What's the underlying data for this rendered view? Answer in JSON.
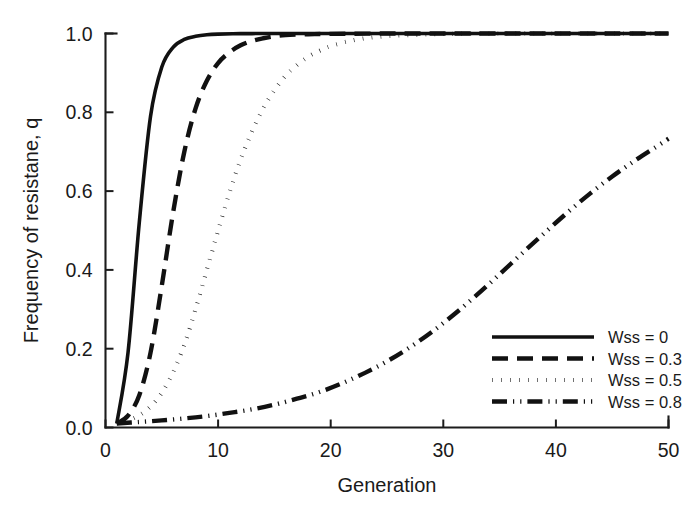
{
  "chart_data": {
    "type": "line",
    "title": "",
    "xlabel": "Generation",
    "ylabel": "Frequency of resistane, q",
    "xlim": [
      0,
      50
    ],
    "ylim": [
      0.0,
      1.0
    ],
    "xticks": [
      0,
      10,
      20,
      30,
      40,
      50
    ],
    "xtick_labels": [
      "0",
      "10",
      "20",
      "30",
      "40",
      "50"
    ],
    "yticks": [
      0.0,
      0.2,
      0.4,
      0.6,
      0.8,
      1.0
    ],
    "ytick_labels": [
      "0.0",
      "0.2",
      "0.4",
      "0.6",
      "0.8",
      "1.0"
    ],
    "grid": false,
    "legend_position": "lower right",
    "series": [
      {
        "name": "Wss = 0",
        "linestyle": "solid",
        "color": "#111111",
        "x": [
          1,
          2,
          3,
          4,
          5,
          6,
          7,
          8,
          9,
          10,
          12,
          14,
          16,
          18,
          20,
          25,
          30,
          35,
          40,
          45,
          50
        ],
        "values": [
          0.01,
          0.19,
          0.52,
          0.79,
          0.915,
          0.965,
          0.985,
          0.993,
          0.997,
          0.9985,
          0.9996,
          0.9999,
          1.0,
          1.0,
          1.0,
          1.0,
          1.0,
          1.0,
          1.0,
          1.0,
          1.0
        ]
      },
      {
        "name": "Wss = 0.3",
        "linestyle": "dashed",
        "color": "#111111",
        "x": [
          1,
          2,
          3,
          4,
          5,
          6,
          7,
          8,
          9,
          10,
          11,
          12,
          13,
          14,
          15,
          16,
          18,
          20,
          25,
          30,
          35,
          40,
          45,
          50
        ],
        "values": [
          0.01,
          0.03,
          0.082,
          0.19,
          0.36,
          0.545,
          0.7,
          0.81,
          0.88,
          0.925,
          0.952,
          0.97,
          0.981,
          0.988,
          0.993,
          0.996,
          0.998,
          0.999,
          1.0,
          1.0,
          1.0,
          1.0,
          1.0,
          1.0
        ]
      },
      {
        "name": "Wss = 0.5",
        "linestyle": "dotted",
        "color": "#111111",
        "x": [
          1,
          2,
          3,
          4,
          5,
          6,
          7,
          8,
          9,
          10,
          11,
          12,
          13,
          14,
          15,
          16,
          17,
          18,
          19,
          20,
          22,
          24,
          26,
          28,
          30,
          35,
          40,
          45,
          50
        ],
        "values": [
          0.01,
          0.018,
          0.031,
          0.053,
          0.088,
          0.14,
          0.21,
          0.3,
          0.4,
          0.5,
          0.595,
          0.68,
          0.75,
          0.81,
          0.856,
          0.893,
          0.92,
          0.941,
          0.956,
          0.968,
          0.983,
          0.991,
          0.995,
          0.997,
          0.999,
          1.0,
          1.0,
          1.0,
          1.0
        ]
      },
      {
        "name": "Wss = 0.8",
        "linestyle": "dashdot",
        "color": "#111111",
        "x": [
          1,
          3,
          5,
          7,
          9,
          11,
          13,
          15,
          17,
          19,
          21,
          23,
          25,
          27,
          29,
          31,
          33,
          35,
          37,
          39,
          41,
          43,
          45,
          47,
          49,
          50
        ],
        "values": [
          0.01,
          0.014,
          0.018,
          0.023,
          0.029,
          0.037,
          0.046,
          0.058,
          0.073,
          0.09,
          0.112,
          0.138,
          0.168,
          0.203,
          0.243,
          0.288,
          0.337,
          0.389,
          0.442,
          0.494,
          0.545,
          0.593,
          0.637,
          0.677,
          0.714,
          0.733
        ]
      }
    ]
  },
  "legend": {
    "entries": [
      {
        "label": "Wss = 0",
        "style": "solid"
      },
      {
        "label": "Wss = 0.3",
        "style": "dashed"
      },
      {
        "label": "Wss = 0.5",
        "style": "dotted"
      },
      {
        "label": "Wss = 0.8",
        "style": "dashdot"
      }
    ]
  }
}
